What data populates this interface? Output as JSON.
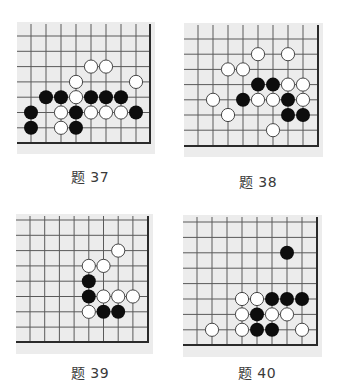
{
  "page": {
    "background": "#ffffff",
    "board_color": "#ececec",
    "line_color": "#5a5a5a",
    "edge_color": "#2a2a2a",
    "black_stone": "#0d0d0d",
    "white_stone": "#ffffff",
    "white_outline": "#333333"
  },
  "problems": [
    {
      "label": "题 37",
      "caption_x": 50,
      "caption_y": 169,
      "bg": {
        "x": 17,
        "y": 22,
        "w": 138,
        "h": 132
      },
      "origin_x": 31,
      "origin_y": 36,
      "dx": 15,
      "dy": 15.3,
      "cols": 8,
      "rows": 7,
      "right_edge_x": 150,
      "bottom_edge_y": 143,
      "stones": [
        {
          "c": 4,
          "r": 2,
          "color": "white"
        },
        {
          "c": 5,
          "r": 2,
          "color": "white"
        },
        {
          "c": 3,
          "r": 3,
          "color": "white"
        },
        {
          "c": 7,
          "r": 3,
          "color": "white"
        },
        {
          "c": 1,
          "r": 4,
          "color": "black"
        },
        {
          "c": 2,
          "r": 4,
          "color": "black"
        },
        {
          "c": 3,
          "r": 4,
          "color": "white"
        },
        {
          "c": 4,
          "r": 4,
          "color": "black"
        },
        {
          "c": 5,
          "r": 4,
          "color": "black"
        },
        {
          "c": 6,
          "r": 4,
          "color": "black"
        },
        {
          "c": 0,
          "r": 5,
          "color": "black"
        },
        {
          "c": 2,
          "r": 5,
          "color": "white"
        },
        {
          "c": 3,
          "r": 5,
          "color": "black"
        },
        {
          "c": 4,
          "r": 5,
          "color": "white"
        },
        {
          "c": 5,
          "r": 5,
          "color": "white"
        },
        {
          "c": 6,
          "r": 5,
          "color": "white"
        },
        {
          "c": 7,
          "r": 5,
          "color": "black"
        },
        {
          "c": 0,
          "r": 6,
          "color": "black"
        },
        {
          "c": 2,
          "r": 6,
          "color": "white"
        },
        {
          "c": 3,
          "r": 6,
          "color": "black"
        }
      ]
    },
    {
      "label": "题 38",
      "caption_x": 218,
      "caption_y": 174,
      "bg": {
        "x": 184,
        "y": 23,
        "w": 139,
        "h": 134
      },
      "origin_x": 198,
      "origin_y": 39,
      "dx": 15,
      "dy": 15.2,
      "cols": 8,
      "rows": 7,
      "right_edge_x": 318,
      "bottom_edge_y": 146,
      "stones": [
        {
          "c": 4,
          "r": 1,
          "color": "white"
        },
        {
          "c": 6,
          "r": 1,
          "color": "white"
        },
        {
          "c": 2,
          "r": 2,
          "color": "white"
        },
        {
          "c": 3,
          "r": 2,
          "color": "white"
        },
        {
          "c": 4,
          "r": 3,
          "color": "black"
        },
        {
          "c": 5,
          "r": 3,
          "color": "black"
        },
        {
          "c": 6,
          "r": 3,
          "color": "white"
        },
        {
          "c": 7,
          "r": 3,
          "color": "white"
        },
        {
          "c": 1,
          "r": 4,
          "color": "white"
        },
        {
          "c": 3,
          "r": 4,
          "color": "black"
        },
        {
          "c": 4,
          "r": 4,
          "color": "white"
        },
        {
          "c": 5,
          "r": 4,
          "color": "white"
        },
        {
          "c": 6,
          "r": 4,
          "color": "black"
        },
        {
          "c": 7,
          "r": 4,
          "color": "white"
        },
        {
          "c": 2,
          "r": 5,
          "color": "white"
        },
        {
          "c": 6,
          "r": 5,
          "color": "black"
        },
        {
          "c": 7,
          "r": 5,
          "color": "black"
        },
        {
          "c": 5,
          "r": 6,
          "color": "white"
        }
      ]
    },
    {
      "label": "题 39",
      "caption_x": 50,
      "caption_y": 365,
      "bg": {
        "x": 16,
        "y": 214,
        "w": 137,
        "h": 140
      },
      "origin_x": 30,
      "origin_y": 220,
      "dx": 14.7,
      "dy": 15.3,
      "cols": 8,
      "rows": 8,
      "right_edge_x": 148,
      "bottom_edge_y": 342,
      "stones": [
        {
          "c": 6,
          "r": 2,
          "color": "white"
        },
        {
          "c": 4,
          "r": 3,
          "color": "white"
        },
        {
          "c": 5,
          "r": 3,
          "color": "white"
        },
        {
          "c": 4,
          "r": 4,
          "color": "black"
        },
        {
          "c": 4,
          "r": 5,
          "color": "black"
        },
        {
          "c": 5,
          "r": 5,
          "color": "white"
        },
        {
          "c": 6,
          "r": 5,
          "color": "white"
        },
        {
          "c": 7,
          "r": 5,
          "color": "white"
        },
        {
          "c": 4,
          "r": 6,
          "color": "white"
        },
        {
          "c": 5,
          "r": 6,
          "color": "black"
        },
        {
          "c": 6,
          "r": 6,
          "color": "black"
        }
      ]
    },
    {
      "label": "题 40",
      "caption_x": 217,
      "caption_y": 365,
      "bg": {
        "x": 183,
        "y": 215,
        "w": 139,
        "h": 142
      },
      "origin_x": 197,
      "origin_y": 222,
      "dx": 15,
      "dy": 15.4,
      "cols": 8,
      "rows": 8,
      "right_edge_x": 317,
      "bottom_edge_y": 345,
      "stones": [
        {
          "c": 6,
          "r": 2,
          "color": "black"
        },
        {
          "c": 3,
          "r": 5,
          "color": "white"
        },
        {
          "c": 4,
          "r": 5,
          "color": "white"
        },
        {
          "c": 5,
          "r": 5,
          "color": "black"
        },
        {
          "c": 6,
          "r": 5,
          "color": "black"
        },
        {
          "c": 7,
          "r": 5,
          "color": "black"
        },
        {
          "c": 3,
          "r": 6,
          "color": "white"
        },
        {
          "c": 4,
          "r": 6,
          "color": "black"
        },
        {
          "c": 5,
          "r": 6,
          "color": "white"
        },
        {
          "c": 6,
          "r": 6,
          "color": "white"
        },
        {
          "c": 1,
          "r": 7,
          "color": "white"
        },
        {
          "c": 3,
          "r": 7,
          "color": "white"
        },
        {
          "c": 4,
          "r": 7,
          "color": "black"
        },
        {
          "c": 5,
          "r": 7,
          "color": "black"
        },
        {
          "c": 7,
          "r": 7,
          "color": "white"
        }
      ]
    }
  ]
}
